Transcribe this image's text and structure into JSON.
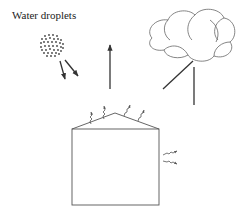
{
  "diagram": {
    "labels": {
      "water_droplets": "Water droplets"
    },
    "colors": {
      "stroke": "#333333",
      "light_stroke": "#777777",
      "background": "#ffffff"
    },
    "elements": [
      {
        "id": "water-droplets-cluster",
        "kind": "dotted-circle",
        "label": "Water droplets"
      },
      {
        "id": "cloud",
        "kind": "cloud-outline"
      },
      {
        "id": "house",
        "kind": "house-outline"
      },
      {
        "id": "droplet-arrows",
        "kind": "arrows",
        "count": 2,
        "direction": "down-right"
      },
      {
        "id": "upward-arrow",
        "kind": "arrow",
        "direction": "up"
      },
      {
        "id": "cloud-arrows",
        "kind": "lines",
        "count": 2,
        "direction": "down"
      },
      {
        "id": "roof-squiggle-arrows",
        "kind": "wavy-arrows",
        "count": 4,
        "direction": "up"
      },
      {
        "id": "wall-squiggle-arrows",
        "kind": "wavy-arrows",
        "count": 2,
        "direction": "right"
      }
    ]
  }
}
